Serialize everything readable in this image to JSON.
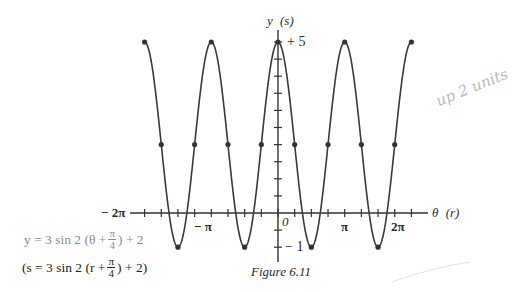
{
  "chart_data": {
    "type": "line",
    "title": "Figure 6.11",
    "function": "y = 3 sin 2 (θ + π/4) + 2",
    "alt_function": "(s = 3 sin 2 (r + π/4) + 2)",
    "xlabel": "θ (r)",
    "ylabel": "y (s)",
    "x_tick_labels": [
      "− 2π",
      "− π",
      "0",
      "π",
      "2π"
    ],
    "x_tick_values": [
      -6.2832,
      -3.1416,
      0,
      3.1416,
      6.2832
    ],
    "x_minor_tick_step": "π/4",
    "y_tick_labels": [
      "+ 5",
      "− 1"
    ],
    "y_tick_values": [
      5,
      -1
    ],
    "y_minor_tick_step": 0.5,
    "xlim": [
      -6.2832,
      7.0
    ],
    "ylim": [
      -1.5,
      5.6
    ],
    "grid": false,
    "marked_points": {
      "x": [
        -6.2832,
        -5.4978,
        -4.7124,
        -3.927,
        -3.1416,
        -2.3562,
        -1.5708,
        -0.7854,
        0,
        0.7854,
        1.5708,
        2.3562,
        3.1416,
        3.927,
        4.7124,
        5.4978,
        6.2832
      ],
      "y": [
        5,
        2,
        -1,
        2,
        5,
        2,
        -1,
        2,
        5,
        2,
        -1,
        2,
        5,
        2,
        -1,
        2,
        5
      ]
    },
    "series": [
      {
        "name": "y = 3 sin 2(θ + π/4) + 2",
        "x_range": [
          -6.2832,
          6.2832
        ],
        "amplitude": 3,
        "period": "π",
        "vertical_shift": 2,
        "phase_shift": "−π/4",
        "max": 5,
        "min": -1
      }
    ]
  },
  "labels": {
    "y_axis": "y",
    "y_axis_alt": "(s)",
    "x_axis": "θ",
    "x_axis_alt": "(r)",
    "y_max": "+ 5",
    "y_min": "− 1",
    "origin": "0",
    "x_neg_2pi": "− 2π",
    "x_neg_pi": "− π",
    "x_pi": "π",
    "x_2pi": "2π"
  },
  "equation1": {
    "prefix": "y = 3 sin 2 (θ + ",
    "num": "π",
    "den": "4",
    "suffix": ") + 2"
  },
  "equation2": {
    "prefix": "(s = 3 sin 2 (r + ",
    "num": "π",
    "den": "4",
    "suffix": ") + 2)"
  },
  "caption": "Figure 6.11",
  "handwriting": "up 2 units"
}
